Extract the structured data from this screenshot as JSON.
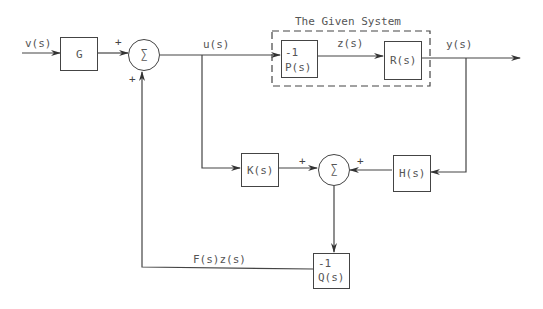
{
  "title": "The Given System",
  "signals": {
    "input": "v(s)",
    "control": "u(s)",
    "internal": "z(s)",
    "output": "y(s)",
    "feedback": "F(s)z(s)"
  },
  "blocks": {
    "g": "G",
    "p_num": "-1",
    "p_den": "P(s)",
    "r": "R(s)",
    "k": "K(s)",
    "h": "H(s)",
    "q_num": "-1",
    "q_den": "Q(s)"
  },
  "summers": {
    "symbol": "∑",
    "sum1_signs": [
      "+",
      "+"
    ],
    "sum2_signs": [
      "+",
      "+"
    ]
  }
}
